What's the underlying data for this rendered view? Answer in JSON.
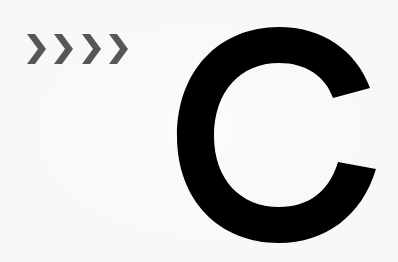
{
  "graphic": {
    "chevrons": {
      "text": ">>>>",
      "count": 4,
      "color": "#575757"
    },
    "letter": {
      "text": "C",
      "color": "#000000"
    },
    "background_color": "#f8f8f7"
  }
}
